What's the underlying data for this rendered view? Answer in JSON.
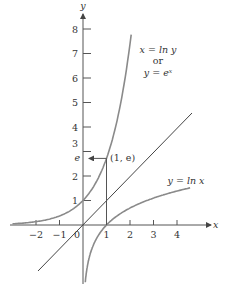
{
  "figure": {
    "axes": {
      "x_label": "x",
      "y_label": "y",
      "origin_label": "0",
      "x_ticks": [
        "−2",
        "−1",
        "1",
        "2",
        "3",
        "4"
      ],
      "y_ticks": [
        "1",
        "2",
        "3",
        "4",
        "5",
        "6",
        "7",
        "8"
      ],
      "y_special_tick": "e"
    },
    "curves": {
      "exp_label_line1": "x = ln y",
      "exp_label_line2": "or",
      "exp_label_line3": "y = eˣ",
      "ln_label": "y = ln x",
      "identity_label": ""
    },
    "point_label": "(1, e)",
    "colors": {
      "curve": "#8a8a8a",
      "axis": "#555555",
      "identity_line": "#444444"
    }
  }
}
